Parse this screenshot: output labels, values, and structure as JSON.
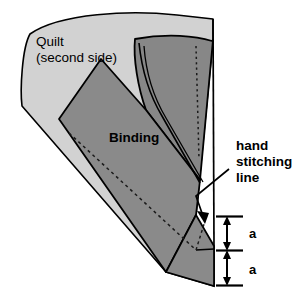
{
  "figure": {
    "background_color": "#ffffff",
    "outline_color": "#000000"
  },
  "regions": {
    "quilt": {
      "label_line1": "Quilt",
      "label_line2": "(second side)",
      "fill_color": "#d2d2d2",
      "icon": "quilt-region"
    },
    "binding": {
      "label": "Binding",
      "fill_color": "#8a8a8a",
      "icon": "binding-region"
    },
    "binding_upper": {
      "fill_color": "#878787",
      "icon": "binding-upper-flap"
    }
  },
  "annotations": {
    "hand_stitching": {
      "line1": "hand",
      "line2": "stitching",
      "line3": "line",
      "leader_icon": "leader-line-arrow"
    },
    "dimensions": [
      {
        "label": "a",
        "icon": "dimension-arrow-a-upper"
      },
      {
        "label": "a",
        "icon": "dimension-arrow-a-lower"
      }
    ]
  },
  "guides": {
    "dashed_stitch_line_icon": "dashed-stitching-guide",
    "dotted_fold_line_icon": "dotted-fold-guide"
  }
}
